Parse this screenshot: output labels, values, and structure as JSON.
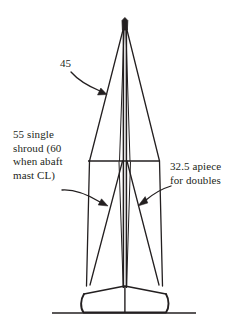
{
  "diagram": {
    "background_color": "#ffffff",
    "ink_color": "#231f20",
    "annotations": {
      "upper_shroud_label": "45",
      "left_label": "55 single\nshroud (60\nwhen abaft\nmast CL)",
      "right_label": "32.5 apiece\nfor doubles"
    },
    "parts": {
      "masthead": "masthead",
      "mast": "mast",
      "upper_shroud_port": "upper-shroud-port",
      "upper_shroud_starboard": "upper-shroud-starboard",
      "spreader": "spreader",
      "lower_shroud_outer_port": "lower-shroud-outer-port",
      "lower_shroud_outer_starboard": "lower-shroud-outer-starboard",
      "lower_shroud_diagonal_port": "lower-shroud-diagonal-port",
      "lower_shroud_diagonal_starboard": "lower-shroud-diagonal-starboard",
      "hull": "hull",
      "deck": "deck",
      "waterline": "waterline"
    }
  }
}
